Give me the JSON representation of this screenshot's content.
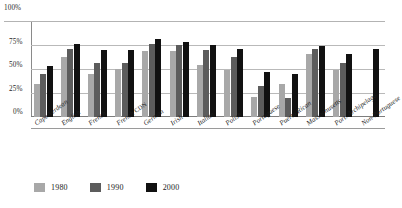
{
  "chart_data": {
    "type": "bar",
    "title": "",
    "xlabel": "",
    "ylabel": "",
    "ylim": [
      0,
      100
    ],
    "grid": true,
    "legend_position": "bottom-left",
    "y_ticks": [
      "0%",
      "25%",
      "50%",
      "75%",
      "100%"
    ],
    "y_tick_values": [
      0,
      25,
      50,
      75,
      100
    ],
    "categories": [
      "Cape Verdean",
      "English",
      "French",
      "French CDN",
      "German",
      "Irish",
      "Italian",
      "Polish",
      "Portuguese",
      "Puerto Rican",
      "Massachusetts",
      "Port. Archipelago",
      "Non-Portuguese"
    ],
    "series": [
      {
        "name": "1980",
        "color": "#a8a8a8",
        "values": [
          35,
          63,
          45,
          51,
          70,
          70,
          55,
          50,
          21,
          35,
          66,
          49,
          null
        ]
      },
      {
        "name": "1990",
        "color": "#5c5c5c",
        "values": [
          45,
          72,
          57,
          57,
          77,
          76,
          71,
          63,
          33,
          20,
          72,
          57,
          null
        ]
      },
      {
        "name": "2000",
        "color": "#111111",
        "values": [
          54,
          77,
          71,
          71,
          82,
          79,
          76,
          72,
          47,
          45,
          75,
          66,
          72
        ]
      }
    ]
  },
  "legend": {
    "items": [
      {
        "label": "1980",
        "color": "#a8a8a8"
      },
      {
        "label": "1990",
        "color": "#5c5c5c"
      },
      {
        "label": "2000",
        "color": "#111111"
      }
    ]
  }
}
